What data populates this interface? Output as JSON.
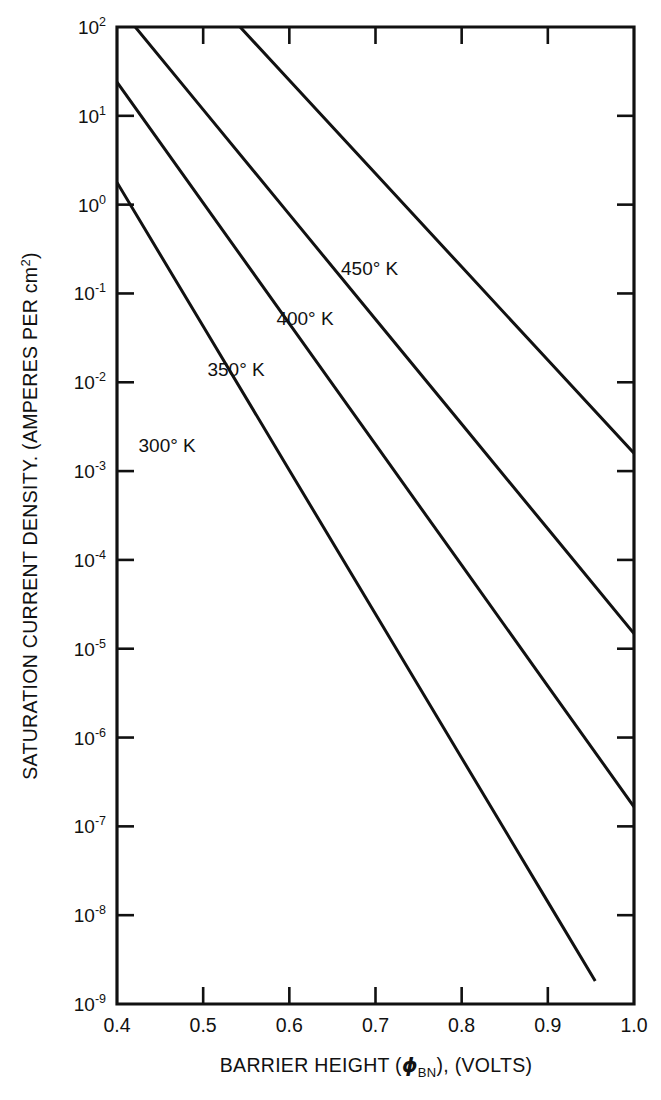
{
  "figure": {
    "background_color": "#ffffff",
    "line_color": "#111111"
  },
  "chart_data": {
    "type": "line",
    "title": "",
    "xlabel": "BARRIER HEIGHT (ϕBN), (VOLTS)",
    "xlabel_parts": {
      "prefix": "BARRIER HEIGHT (",
      "symbol": "ϕ",
      "subscript": "BN",
      "suffix": "), (VOLTS)"
    },
    "ylabel": "SATURATION CURRENT DENSITY. (AMPERES PER cm2)",
    "ylabel_parts": {
      "prefix": "SATURATION CURRENT DENSITY. (AMPERES PER cm",
      "superscript": "2",
      "suffix": ")"
    },
    "xscale": "linear",
    "yscale": "log",
    "xlim": [
      0.4,
      1.0
    ],
    "ylim": [
      1e-09,
      100
    ],
    "grid": false,
    "legend_position": "inline-curve-labels",
    "xticks": [
      0.4,
      0.5,
      0.6,
      0.7,
      0.8,
      0.9,
      1.0
    ],
    "xtick_labels": [
      "0.4",
      "0.5",
      "0.6",
      "0.7",
      "0.8",
      "0.9",
      "1.0"
    ],
    "yticks": [
      100,
      10,
      1,
      0.1,
      0.01,
      0.001,
      0.0001,
      1e-05,
      1e-06,
      1e-07,
      1e-08,
      1e-09
    ],
    "ytick_labels": [
      {
        "mantissa": "10",
        "exponent": "2"
      },
      {
        "mantissa": "10",
        "exponent": "1"
      },
      {
        "mantissa": "10",
        "exponent": "0"
      },
      {
        "mantissa": "10",
        "exponent": "-1"
      },
      {
        "mantissa": "10",
        "exponent": "-2"
      },
      {
        "mantissa": "10",
        "exponent": "-3"
      },
      {
        "mantissa": "10",
        "exponent": "-4"
      },
      {
        "mantissa": "10",
        "exponent": "-5"
      },
      {
        "mantissa": "10",
        "exponent": "-6"
      },
      {
        "mantissa": "10",
        "exponent": "-7"
      },
      {
        "mantissa": "10",
        "exponent": "-8"
      },
      {
        "mantissa": "10",
        "exponent": "-9"
      }
    ],
    "series": [
      {
        "name": "450° K",
        "label": "450° K",
        "x": [
          0.4,
          0.5,
          0.6,
          0.7,
          0.8,
          0.9,
          1.0
        ],
        "y_log10": [
          3.5,
          2.45,
          1.4,
          0.35,
          -0.7,
          -1.75,
          -2.8
        ],
        "y": [
          3160,
          282,
          25.1,
          2.24,
          0.2,
          0.0178,
          0.00158
        ],
        "label_x": 0.66,
        "label_y_log10": -0.72
      },
      {
        "name": "400° K",
        "label": "400° K",
        "x": [
          0.4,
          0.5,
          0.6,
          0.7,
          0.8,
          0.9,
          1.0
        ],
        "y_log10": [
          2.25,
          1.07,
          -0.11,
          -1.29,
          -2.47,
          -3.65,
          -4.83
        ],
        "y": [
          178,
          11.7,
          0.776,
          0.0513,
          0.0034,
          0.000224,
          1.48e-05
        ],
        "label_x": 0.585,
        "label_y_log10": -1.29
      },
      {
        "name": "350° K",
        "label": "350° K",
        "x": [
          0.4,
          0.5,
          0.6,
          0.7,
          0.8,
          0.9,
          1.0
        ],
        "y_log10": [
          1.38,
          0.02,
          -1.34,
          -2.7,
          -4.06,
          -5.42,
          -6.78
        ],
        "y": [
          24.0,
          1.05,
          0.0457,
          0.002,
          8.7e-05,
          3.8e-06,
          1.66e-07
        ],
        "label_x": 0.505,
        "label_y_log10": -1.86
      },
      {
        "name": "300° K",
        "label": "300° K",
        "x": [
          0.4,
          0.5,
          0.6,
          0.7,
          0.8,
          0.9,
          0.955
        ],
        "y_log10": [
          0.25,
          -1.37,
          -2.99,
          -4.61,
          -6.23,
          -7.85,
          -8.74
        ],
        "y": [
          1.78,
          0.0427,
          0.00102,
          2.45e-05,
          5.9e-07,
          1.41e-08,
          1.8e-09
        ],
        "label_x": 0.425,
        "label_y_log10": -2.72
      }
    ]
  }
}
